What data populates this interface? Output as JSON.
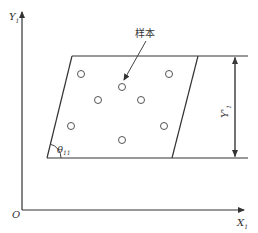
{
  "diagram": {
    "axes": {
      "y_label": "Y",
      "y_sub": "1",
      "x_label": "X",
      "x_sub": "1",
      "origin_label": "O"
    },
    "annotation_label": "样本",
    "angle_label": "θ",
    "angle_sub": "11",
    "height_label": "Y'",
    "height_sub": "1",
    "sample_count": 8
  }
}
